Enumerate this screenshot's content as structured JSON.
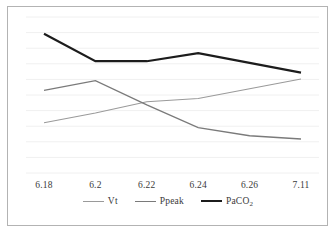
{
  "chart_data": {
    "type": "line",
    "title": "",
    "xlabel": "",
    "ylabel": "",
    "grid": true,
    "legend_position": "bottom",
    "categories": [
      "6.18",
      "6.2",
      "6.22",
      "6.24",
      "6.26",
      "7.11"
    ],
    "series": [
      {
        "name": "Vt",
        "color": "#9a9a9a",
        "width": 1.1,
        "values": [
          31,
          37,
          44,
          46,
          52,
          58
        ]
      },
      {
        "name": "Ppeak",
        "color": "#7a7a7a",
        "width": 1.3,
        "values": [
          51,
          57,
          42,
          28,
          23,
          21
        ]
      },
      {
        "name": "PaCO2",
        "color": "#1c1c1c",
        "width": 2.2,
        "values": [
          86,
          69,
          69,
          74,
          68,
          62
        ]
      }
    ],
    "ylim": [
      0,
      100
    ],
    "gridline_count": 11
  },
  "axis": {
    "ticks": [
      {
        "label": "6.18"
      },
      {
        "label": "6.2"
      },
      {
        "label": "6.22"
      },
      {
        "label": "6.24"
      },
      {
        "label": "6.26"
      },
      {
        "label": "7.11"
      }
    ]
  },
  "legend": {
    "items": [
      {
        "label": "Vt",
        "sub": "",
        "color": "#9a9a9a",
        "width": 1.1
      },
      {
        "label": "Ppeak",
        "sub": "",
        "color": "#7a7a7a",
        "width": 1.3
      },
      {
        "label": "PaCO",
        "sub": "2",
        "color": "#1c1c1c",
        "width": 2.2
      }
    ]
  }
}
